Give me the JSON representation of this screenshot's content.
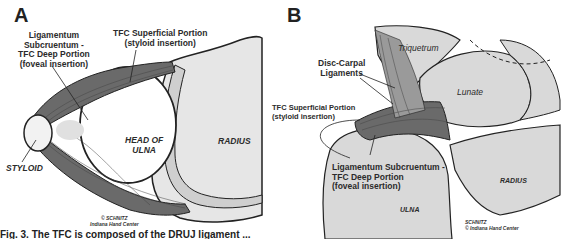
{
  "figure": {
    "panels": [
      {
        "letter": "A",
        "labels": {
          "deep_portion": [
            "Ligamentum",
            "Subcruentum -",
            "TFC Deep Portion",
            "(foveal insertion)"
          ],
          "superficial_portion": [
            "TFC Superficial Portion",
            "(styloid insertion)"
          ],
          "styloid": "STYLOID",
          "head_of_ulna": [
            "HEAD OF",
            "ULNA"
          ],
          "radius": "RADIUS"
        },
        "credit": [
          "© SCHNITZ",
          "Indiana Hand Center"
        ]
      },
      {
        "letter": "B",
        "labels": {
          "triquetrum": "Triquetrum",
          "disc_carpal": [
            "Disc-Carpal",
            "Ligaments"
          ],
          "lunate": "Lunate",
          "superficial_portion": [
            "TFC Superficial Portion",
            "(styloid insertion)"
          ],
          "deep_portion": [
            "Ligamentum Subcruentum -",
            "TFC Deep Portion",
            "(foveal insertion)"
          ],
          "radius": "RADIUS",
          "ulna": "ULNA"
        },
        "credit": [
          "SCHNITZ",
          "© Indiana Hand Center"
        ]
      }
    ],
    "caption": "Fig. 3. The TFC is composed of the DRUJ ligament ..."
  },
  "colors": {
    "bone_fill": "#d9d9d9",
    "ligament": "#555555",
    "outline": "#222222"
  }
}
